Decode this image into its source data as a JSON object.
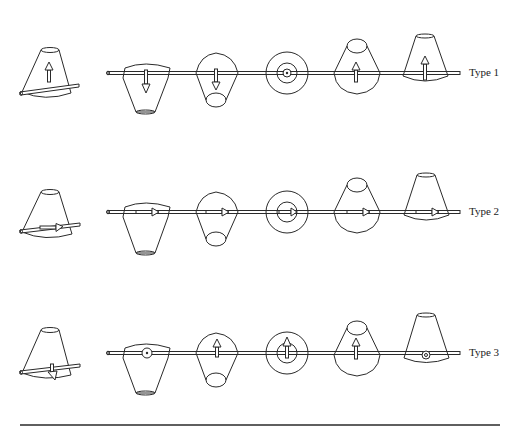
{
  "header_text": "",
  "rows": [
    {
      "label": "Type 1",
      "rod_y": 73,
      "arrow_mode": "vertical"
    },
    {
      "label": "Type 2",
      "rod_y": 212,
      "arrow_mode": "horizontal"
    },
    {
      "label": "Type 3",
      "rod_y": 353,
      "arrow_mode": "mixed"
    }
  ],
  "shape_positions_x": [
    145,
    215,
    287,
    357,
    425
  ],
  "colors": {
    "line": "#2a2a2a",
    "background": "#ffffff"
  }
}
